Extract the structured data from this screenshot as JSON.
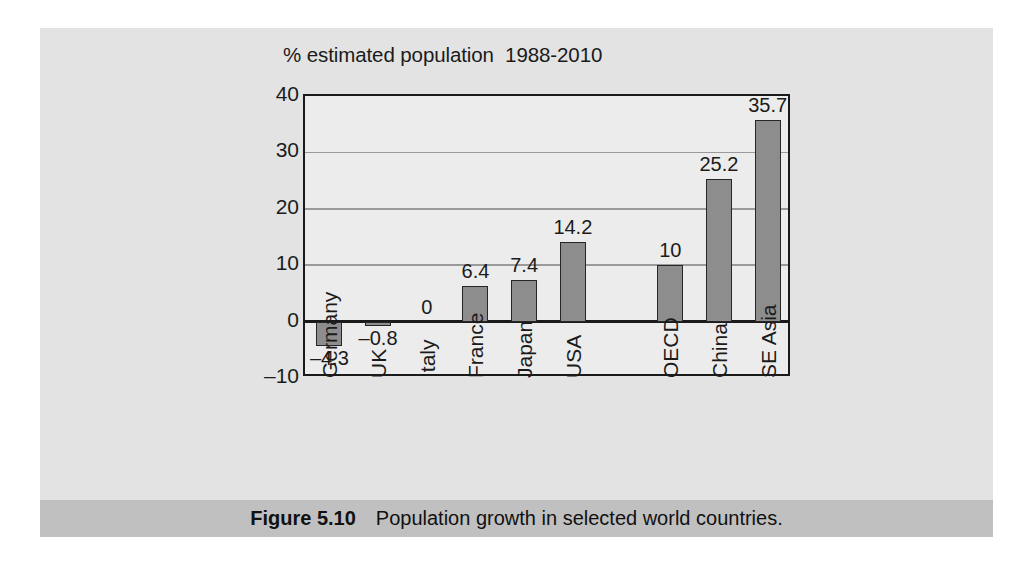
{
  "figure": {
    "caption_label": "Figure 5.10",
    "caption_text": "Population growth in selected world countries.",
    "panel_color": "#e3e3e3",
    "caption_bar_color": "#c0c0c0"
  },
  "chart_data": {
    "type": "bar",
    "title": "% estimated population  1988-2010",
    "xlabel": "",
    "ylabel": "",
    "ylim": [
      -10,
      40
    ],
    "yticks": [
      40,
      30,
      20,
      10,
      0,
      -10
    ],
    "ytick_labels": [
      "40",
      "30",
      "20",
      "10",
      "0",
      "–10"
    ],
    "gridlines": [
      30,
      20,
      10
    ],
    "zero_line": 0,
    "grid": true,
    "legend": "none",
    "bar_color": "#8d8d8d",
    "bar_edge_color": "#262626",
    "categories": [
      "Germany",
      "UK",
      "Italy",
      "France",
      "Japan",
      "USA",
      "",
      "OECD",
      "China",
      "SE Asia"
    ],
    "values": [
      -4.3,
      -0.8,
      0,
      6.4,
      7.4,
      14.2,
      null,
      10,
      25.2,
      35.7
    ],
    "data_labels": [
      "–4.3",
      "–0.8",
      "0",
      "6.4",
      "7.4",
      "14.2",
      "",
      "10",
      "25.2",
      "35.7"
    ]
  }
}
